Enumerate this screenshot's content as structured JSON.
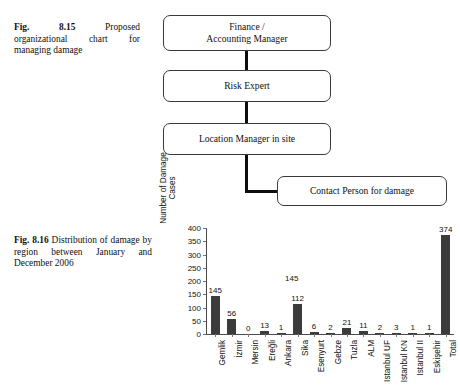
{
  "figure_815": {
    "caption_lead": "Fig. 8.15",
    "caption_text": "Proposed organizational chart for managing damage",
    "nodes": [
      {
        "id": "finance",
        "line1": "Finance /",
        "line2": "Accounting Manager"
      },
      {
        "id": "risk",
        "line1": "Risk Expert",
        "line2": ""
      },
      {
        "id": "location",
        "line1": "Location Manager in site",
        "line2": ""
      },
      {
        "id": "contact",
        "line1": "Contact Person for damage",
        "line2": ""
      }
    ]
  },
  "figure_816": {
    "caption_lead": "Fig. 8.16",
    "caption_text": "Distribution of damage by region between January and December 2006"
  },
  "chart_data": {
    "type": "bar",
    "title": "",
    "xlabel": "",
    "ylabel": "Number of Damage Cases",
    "ylabel_line1": "Number of Damage",
    "ylabel_line2": "Cases",
    "ylim": [
      0,
      400
    ],
    "yticks": [
      0,
      50,
      100,
      150,
      200,
      250,
      300,
      350,
      400
    ],
    "grid": false,
    "legend": "none",
    "bar_color": "#3b3b3b",
    "stray_label": "145",
    "categories": [
      "Gemlik",
      "İzmir",
      "Mersin",
      "Ereğli",
      "Ankara",
      "Sika",
      "Esenyurt",
      "Gebze",
      "Tuzla",
      "ALM",
      "Istanbul UF",
      "Istanbul KN",
      "Istanbul II",
      "Eskişehir",
      "Total"
    ],
    "values": [
      145,
      56,
      0,
      13,
      1,
      112,
      6,
      2,
      21,
      11,
      2,
      3,
      1,
      1,
      374
    ],
    "labels": [
      "145",
      "56",
      "0",
      "13",
      "1",
      "112",
      "6",
      "2",
      "21",
      "11",
      "2",
      "3",
      "1",
      "1",
      "374"
    ]
  }
}
